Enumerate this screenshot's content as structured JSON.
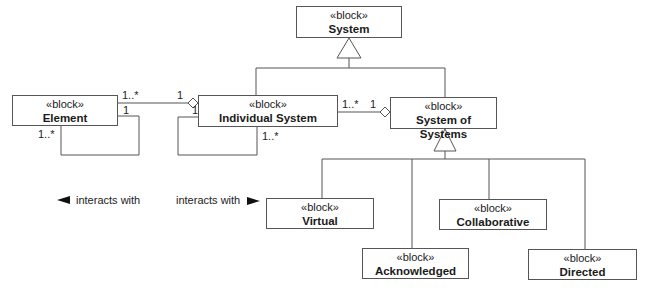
{
  "diagram": {
    "type": "SysML block definition diagram",
    "stereotype": "«block»",
    "blocks": [
      {
        "id": "system",
        "name": "System"
      },
      {
        "id": "element",
        "name": "Element"
      },
      {
        "id": "individual",
        "name": "Individual System"
      },
      {
        "id": "sos",
        "name": "System of Systems"
      },
      {
        "id": "virtual",
        "name": "Virtual"
      },
      {
        "id": "collaborative",
        "name": "Collaborative"
      },
      {
        "id": "acknowledged",
        "name": "Acknowledged"
      },
      {
        "id": "directed",
        "name": "Directed"
      }
    ],
    "multiplicities": {
      "element_to_individual_element_end": "1..*",
      "element_to_individual_individual_end": "1",
      "element_self_top": "1",
      "element_self_bottom": "1..*",
      "individual_self_top": "1",
      "individual_self_bottom": "1..*",
      "individual_to_sos_individual_end": "1..*",
      "individual_to_sos_sos_end": "1"
    },
    "association_labels": {
      "element_self": "interacts with",
      "individual_self": "interacts with"
    },
    "relationships": [
      {
        "type": "aggregation",
        "from": "Element",
        "to": "Individual System"
      },
      {
        "type": "aggregation",
        "from": "Individual System",
        "to": "System of Systems"
      },
      {
        "type": "association",
        "from": "Element",
        "to": "Element",
        "label": "interacts with"
      },
      {
        "type": "association",
        "from": "Individual System",
        "to": "Individual System",
        "label": "interacts with"
      },
      {
        "type": "generalization",
        "from": "Individual System",
        "to": "System"
      },
      {
        "type": "generalization",
        "from": "System of Systems",
        "to": "System"
      },
      {
        "type": "generalization",
        "from": "Virtual",
        "to": "System of Systems"
      },
      {
        "type": "generalization",
        "from": "Collaborative",
        "to": "System of Systems"
      },
      {
        "type": "generalization",
        "from": "Acknowledged",
        "to": "System of Systems"
      },
      {
        "type": "generalization",
        "from": "Directed",
        "to": "System of Systems"
      }
    ]
  }
}
